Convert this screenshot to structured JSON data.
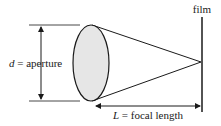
{
  "diagram": {
    "labels": {
      "film": "film",
      "aperture_var": "d",
      "aperture_text": " = aperture",
      "focal_var": "L",
      "focal_text": " = focal length"
    },
    "colors": {
      "stroke": "#1a1a1a",
      "lens_fill": "#e6e6e6",
      "background": "#ffffff"
    }
  }
}
